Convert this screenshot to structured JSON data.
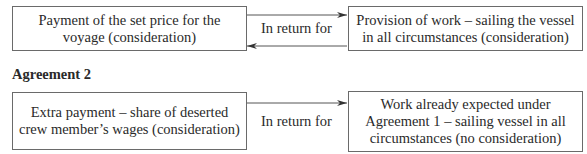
{
  "agreement1": {
    "left_box": "Payment of the set price for the voyage (consideration)",
    "connector_label": "In return for",
    "right_box": "Provision of work – sailing the vessel in all circumstances (consideration)"
  },
  "agreement2": {
    "heading": "Agreement 2",
    "left_box": "Extra payment – share of deserted crew member’s wages (consideration)",
    "connector_label": "In return for",
    "right_box": "Work already expected under Agreement 1 – sailing vessel in all circumstances (no consideration)"
  }
}
